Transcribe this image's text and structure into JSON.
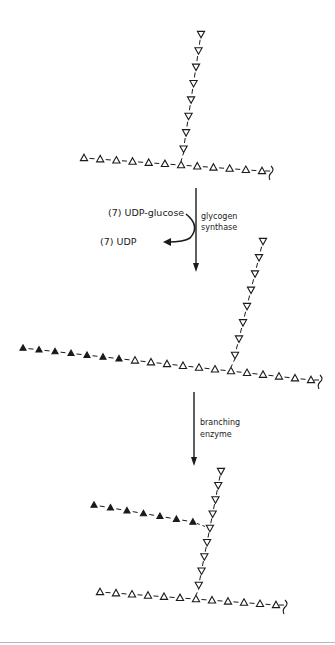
{
  "legend": {
    "open_triangle": "glucose residue (pre-existing)",
    "filled_triangle": "glucose residue (newly added)"
  },
  "colors": {
    "ink": "#1a1a1a",
    "rule": "#b8b8b8"
  },
  "steps": [
    {
      "reactant_label": "(7) UDP-glucose",
      "product_label": "(7) UDP",
      "enzyme_label_lines": [
        "glycogen",
        "synthase"
      ]
    },
    {
      "enzyme_label_lines": [
        "branching",
        "enzyme"
      ]
    }
  ],
  "structures": [
    {
      "name": "initial-glycogen",
      "main_chain": {
        "before_junction_open": 6,
        "junction": 1,
        "after_junction_open": 5,
        "reducing_end_symbol": "squiggle"
      },
      "branch": {
        "open_residues": 8
      }
    },
    {
      "name": "elongated-glycogen",
      "main_chain": {
        "new_filled": 7,
        "before_junction_open": 6,
        "junction": 1,
        "after_junction_open": 5,
        "reducing_end_symbol": "squiggle"
      },
      "branch": {
        "open_residues": 8
      }
    },
    {
      "name": "branched-glycogen",
      "main_chain": {
        "before_junction_open": 6,
        "junction": 1,
        "after_junction_open": 5,
        "reducing_end_symbol": "squiggle"
      },
      "branch": {
        "open_residues_below_new_branch": 4,
        "branch_point": 1,
        "open_residues_above_new_branch": 4
      },
      "new_branch": {
        "filled_residues": 7
      }
    }
  ]
}
